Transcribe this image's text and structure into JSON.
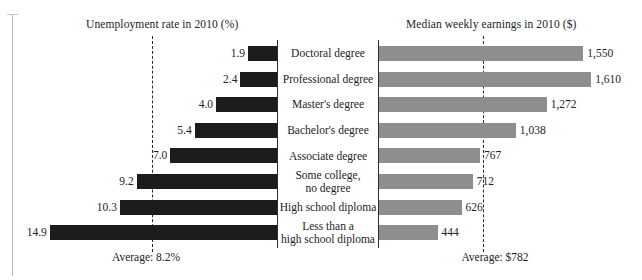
{
  "chart_data": {
    "type": "bar",
    "orientation": "horizontal",
    "layout": "diverging-dual-panel",
    "title": "",
    "categories": [
      "Doctoral degree",
      "Professional degree",
      "Master's degree",
      "Bachelor's degree",
      "Associate degree",
      "Some college, no degree",
      "High school diploma",
      "Less than a high school diploma"
    ],
    "category_lines": [
      [
        "Doctoral degree"
      ],
      [
        "Professional degree"
      ],
      [
        "Master's degree"
      ],
      [
        "Bachelor's degree"
      ],
      [
        "Associate degree"
      ],
      [
        "Some college,",
        "no degree"
      ],
      [
        "High school diploma"
      ],
      [
        "Less than a",
        "high school diploma"
      ]
    ],
    "series": [
      {
        "name": "Unemployment rate in 2010 (%)",
        "side": "left",
        "direction": "right-to-left",
        "unit": "%",
        "color": "#1c1c1c",
        "values": [
          1.9,
          2.4,
          4.0,
          5.4,
          7.0,
          9.2,
          10.3,
          14.9
        ],
        "value_labels": [
          "1.9",
          "2.4",
          "4.0",
          "5.4",
          "7.0",
          "9.2",
          "10.3",
          "14.9"
        ],
        "max_scale": 14.9,
        "average": 8.2,
        "average_label": "Average: 8.2%"
      },
      {
        "name": "Median weekly earnings in 2010 ($)",
        "side": "right",
        "direction": "left-to-right",
        "unit": "$",
        "color": "#8e8e8e",
        "values": [
          1550,
          1610,
          1272,
          1038,
          767,
          712,
          626,
          444
        ],
        "value_labels": [
          "1,550",
          "1,610",
          "1,272",
          "1,038",
          "767",
          "712",
          "626",
          "444"
        ],
        "max_scale": 1610,
        "average": 782,
        "average_label": "Average: $782"
      }
    ],
    "grid": false,
    "legend": "none",
    "annotations": [
      "Average: 8.2%",
      "Average: $782"
    ]
  },
  "titles": {
    "left": "Unemployment rate in 2010 (%)",
    "right": "Median weekly earnings in 2010 ($)"
  },
  "averages": {
    "left_label": "Average: 8.2%",
    "right_label": "Average: $782"
  },
  "colors": {
    "unemployment_bar": "#1c1c1c",
    "earnings_bar": "#8e8e8e",
    "axis": "#2b2b2b",
    "text": "#232323",
    "background": "#ffffff"
  }
}
